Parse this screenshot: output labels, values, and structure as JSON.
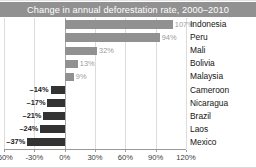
{
  "chart_data": {
    "type": "bar",
    "orientation": "horizontal",
    "title": "Change in annual deforestation rate, 2000–2010",
    "xlabel": "",
    "ylabel": "",
    "categories": [
      "Indonesia",
      "Peru",
      "Mali",
      "Bolivia",
      "Malaysia",
      "Cameroon",
      "Nicaragua",
      "Brazil",
      "Laos",
      "Mexico"
    ],
    "values": [
      107,
      94,
      32,
      13,
      9,
      -14,
      -17,
      -21,
      -24,
      -37
    ],
    "value_labels": [
      "107%",
      "94%",
      "32%",
      "13%",
      "9%",
      "–14%",
      "–17%",
      "–21%",
      "–24%",
      "–37%"
    ],
    "xlim": [
      -60,
      120
    ],
    "xticks": [
      -60,
      -30,
      0,
      30,
      60,
      90,
      120
    ],
    "xtick_labels": [
      "-60%",
      "-30%",
      "0%",
      "30%",
      "60%",
      "90%",
      "120%"
    ],
    "grid": true,
    "legend": null,
    "colors": {
      "positive_bar": "#919191",
      "negative_bar": "#333333",
      "positive_label": "#9a9a9a",
      "negative_label": "#1c1c1c",
      "title_band": "#919191",
      "title_text": "#ffffff",
      "gridline": "#dcdcdc",
      "axis": "#9a9a9a",
      "background": "#ffffff"
    }
  }
}
